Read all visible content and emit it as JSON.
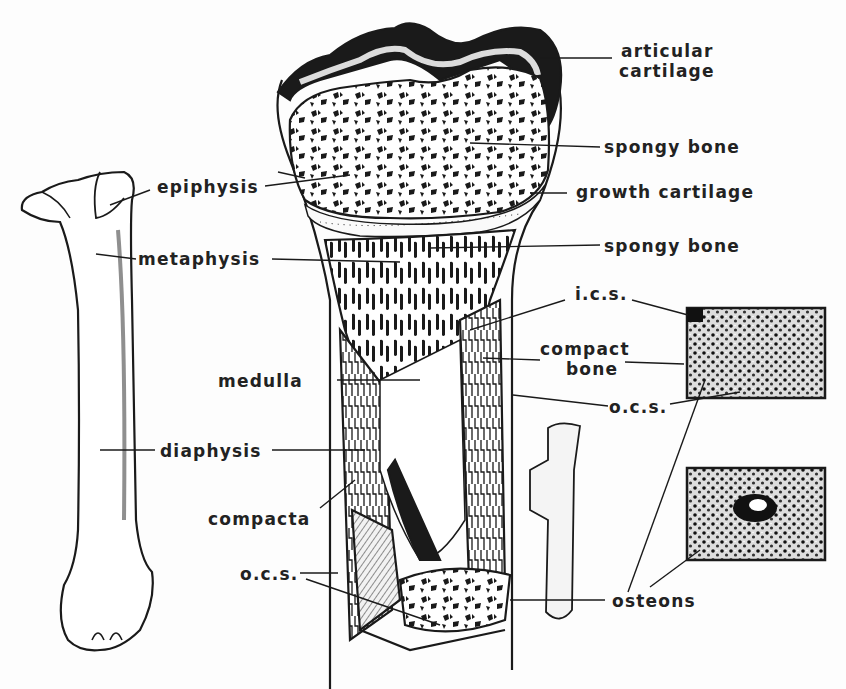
{
  "diagram": {
    "colors": {
      "ink": "#1a1a1a",
      "paper": "#fdfdfd",
      "label": "#222222"
    },
    "labels": {
      "articular_cartilage_1": "articular",
      "articular_cartilage_2": "cartilage",
      "spongy_bone_top": "spongy bone",
      "growth_cartilage": "growth cartilage",
      "spongy_bone_mid": "spongy bone",
      "epiphysis": "epiphysis",
      "metaphysis": "metaphysis",
      "ics": "i.c.s.",
      "compact_bone_1": "compact",
      "compact_bone_2": "bone",
      "medulla": "medulla",
      "ocs_right": "o.c.s.",
      "diaphysis": "diaphysis",
      "compacta": "compacta",
      "ocs_left": "o.c.s.",
      "osteons": "osteons"
    },
    "panels": [
      {
        "name": "whole-bone-view"
      },
      {
        "name": "sectioned-bone-view"
      },
      {
        "name": "compact-bone-inset"
      },
      {
        "name": "osteon-inset"
      }
    ]
  }
}
